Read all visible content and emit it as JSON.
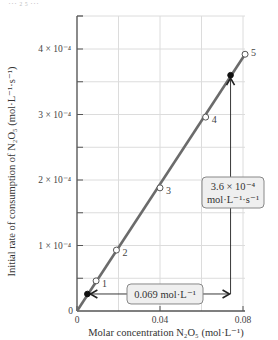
{
  "chart_data": {
    "type": "scatter",
    "title": "",
    "xlabel": "Molar concentration N₂O₅ (mol·L⁻¹)",
    "ylabel": "Initial rate of consumption of N₂O₅ (mol·L⁻¹·s⁻¹)",
    "xlim": [
      0,
      0.08
    ],
    "ylim": [
      0,
      0.0004
    ],
    "grid": true,
    "x_ticks": [
      {
        "value": 0,
        "label": "0"
      },
      {
        "value": 0.04,
        "label": "0.04"
      },
      {
        "value": 0.08,
        "label": "0.08"
      }
    ],
    "x_gridlines": [
      0,
      0.02,
      0.04,
      0.06,
      0.08
    ],
    "y_ticks": [
      {
        "value": 0,
        "label": "0"
      },
      {
        "value": 0.0001,
        "label": "1 × 10⁻⁴"
      },
      {
        "value": 0.0002,
        "label": "2 × 10⁻⁴"
      },
      {
        "value": 0.0003,
        "label": "3 × 10⁻⁴"
      },
      {
        "value": 0.0004,
        "label": "4 × 10⁻⁴"
      }
    ],
    "y_gridlines": [
      5e-05,
      0.0001,
      0.00015,
      0.0002,
      0.00025,
      0.0003,
      0.00035,
      0.0004
    ],
    "series": [
      {
        "name": "experiments",
        "x": [
          0.0092,
          0.019,
          0.04,
          0.062,
          0.081
        ],
        "y": [
          4.6e-05,
          9.3e-05,
          0.000188,
          0.000296,
          0.000392
        ],
        "labels": [
          "1",
          "2",
          "3",
          "4",
          "5"
        ],
        "marker": "open-circle"
      }
    ],
    "fit_line": {
      "x": [
        0,
        0.081
      ],
      "y": [
        0,
        0.000392
      ]
    },
    "highlight_points": [
      {
        "x": 0.005,
        "y": 2.6e-05
      },
      {
        "x": 0.074,
        "y": 0.00036
      }
    ],
    "annotations": [
      {
        "text": "0.069 mol·L⁻¹",
        "kind": "horizontal-span",
        "from_x": 0.005,
        "to_x": 0.074,
        "at_y": 2.6e-05
      },
      {
        "text_line1": "3.6 × 10⁻⁴",
        "text_line2": "mol·L⁻¹·s⁻¹",
        "kind": "vertical-span",
        "at_x": 0.074,
        "from_y": 2.6e-05,
        "to_y": 0.00036
      }
    ],
    "colors": {
      "line": "#6b6b6b",
      "grid": "#dcdcdc",
      "axis": "#555555",
      "box_fill": "#efefef",
      "box_stroke": "#888888",
      "arrow": "#222222"
    }
  },
  "cropped_text": "… ₂ ₅ …"
}
